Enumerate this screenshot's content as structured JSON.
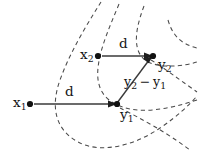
{
  "figure": {
    "type": "math-diagram",
    "background_color": "#ffffff",
    "ink_color": "#141414",
    "dash_color": "#4a4a4a",
    "width": 198,
    "height": 164
  },
  "labels": {
    "x1": {
      "base": "x",
      "sub": "1"
    },
    "x2": {
      "base": "x",
      "sub": "2"
    },
    "y1": {
      "base": "y",
      "sub": "1"
    },
    "y2": {
      "base": "y",
      "sub": "2"
    },
    "d_lower": "d",
    "d_upper": "d",
    "difference": {
      "minuend": "y",
      "minuend_sub": "2",
      "operator": "−",
      "subtrahend": "y",
      "subtrahend_sub": "1"
    }
  },
  "points": [
    {
      "name": "x1",
      "x": 30,
      "y": 104
    },
    {
      "name": "x2",
      "x": 98,
      "y": 56
    },
    {
      "name": "y1",
      "x": 117,
      "y": 104
    },
    {
      "name": "y2",
      "x": 153,
      "y": 56
    }
  ],
  "arrows": [
    {
      "name": "x1-to-y1",
      "from": "x1",
      "to": "y1",
      "label": "d"
    },
    {
      "name": "x2-to-y2",
      "from": "x2",
      "to": "y2",
      "label": "d"
    },
    {
      "name": "y1-to-y2",
      "from": "y1",
      "to": "y2",
      "label": "y2 − y1"
    }
  ],
  "flow_curves": {
    "count": 4,
    "style": "dashed",
    "note": "nested open curves fanning from top, bending around the lower left and sweeping to the right"
  }
}
